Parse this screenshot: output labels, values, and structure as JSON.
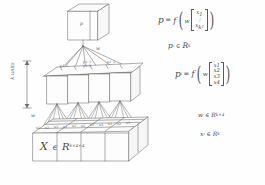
{
  "diagram": {
    "background_color": "#fefefe",
    "ink_color": "#5a5a5a",
    "top_cube": {
      "label": "p"
    },
    "height_arrow": {
      "label": "k units"
    },
    "weight_labels": [
      {
        "label": "w"
      },
      {
        "label": "w"
      }
    ],
    "middle_layer": {
      "boxes": [
        {
          "label": "p1.1"
        },
        {
          "label": "p1.2"
        },
        {
          "label": "p1.3"
        },
        {
          "label": "p1.4"
        }
      ]
    },
    "input_slab": {
      "cell_labels": [
        "x1",
        "x2",
        "x3",
        "x4",
        "x1",
        "x2",
        "x3",
        "x4",
        "x1",
        "x2",
        "x3"
      ]
    }
  },
  "equations": {
    "top": {
      "lhs": "p",
      "equals": "=",
      "fn": "f",
      "weight": "w",
      "vector": [
        "x",
        "⋮",
        "x"
      ],
      "vector_first_sub": "1",
      "vector_last_sub": "k²"
    },
    "top_membership": {
      "symbol": "p",
      "symbol_sub": "i",
      "in": "∈",
      "space": "R",
      "space_sup": "k"
    },
    "lower": {
      "lhs": "p",
      "lhs_sub": "i",
      "equals": "=",
      "fn": "f",
      "weight": "w",
      "vector": [
        "x1",
        "x2",
        "x3",
        "x4"
      ]
    },
    "w_membership": {
      "symbol": "w",
      "in": "∈",
      "space": "R",
      "space_sup": "k×4"
    },
    "x_membership": {
      "symbol": "x",
      "symbol_sub": "i",
      "in": "∈",
      "space": "R",
      "space_sup": "k"
    },
    "input_membership": {
      "symbol": "X",
      "in": "∈",
      "space": "R",
      "space_sup": "k×4×4"
    }
  }
}
